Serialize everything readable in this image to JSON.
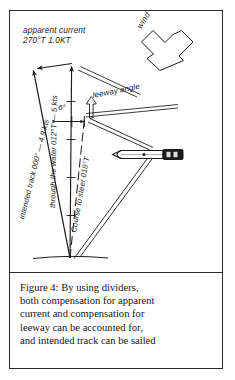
{
  "figure": {
    "caption_lines": [
      "Figure 4: By using dividers,",
      "both compensation for apparent",
      "current and compensation for",
      "leeway can be accounted for,",
      "and intended track can be sailed"
    ]
  },
  "diagram": {
    "labels": {
      "apparent_current_name": "apparent current",
      "apparent_current_value": "270°T 1.0KT",
      "wind": "wind",
      "leeway_angle": "leeway angle",
      "leeway_value": "6°",
      "intended_track": "intended track 000° — 4.9 kts",
      "through_the_water": "through the water 012°T — 5 kts",
      "course_to_steer": "Course to steer 018°T"
    },
    "colors": {
      "ink": "#1b1b1b",
      "frame": "#2b2b2b",
      "paper": "#ffffff",
      "divider_body": "#ffffff",
      "divider_handle": "#1b1b1b"
    },
    "icons": {
      "wind_arrow": "wind-arrow-icon",
      "leeway_arrow": "leeway-arrow-icon",
      "dividers": "dividers-tool-icon",
      "vector_arrowhead": "arrowhead-icon"
    }
  }
}
